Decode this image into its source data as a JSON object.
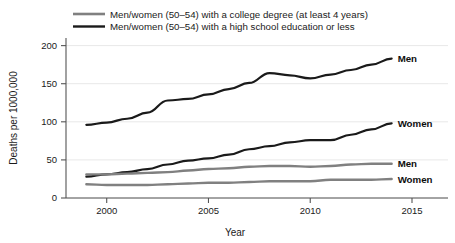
{
  "chart_data": {
    "type": "line",
    "title": "",
    "xlabel": "Year",
    "ylabel": "Deaths per 1000,000",
    "xlim": [
      1998,
      2015
    ],
    "ylim": [
      0,
      210
    ],
    "xticks": [
      2000,
      2005,
      2010,
      2015
    ],
    "yticks": [
      0,
      50,
      100,
      150,
      200
    ],
    "grid": "horizontal",
    "legend_position": "top-left",
    "legend": [
      {
        "label": "Men/women (50–54) with a college degree (at least 4 years)",
        "color": "#808080"
      },
      {
        "label": "Men/women (50–54) with a high school education or less",
        "color": "#1a1a1a"
      }
    ],
    "x": [
      1999,
      2000,
      2001,
      2002,
      2003,
      2004,
      2005,
      2006,
      2007,
      2008,
      2009,
      2010,
      2011,
      2012,
      2013,
      2014
    ],
    "series": [
      {
        "name": "Men",
        "group": "high school or less",
        "color": "#1a1a1a",
        "end_label": "Men",
        "values": [
          96,
          99,
          104,
          112,
          128,
          130,
          136,
          143,
          151,
          164,
          161,
          157,
          162,
          168,
          175,
          183
        ]
      },
      {
        "name": "Women",
        "group": "high school or less",
        "color": "#1a1a1a",
        "end_label": "Women",
        "values": [
          28,
          31,
          34,
          38,
          44,
          49,
          52,
          57,
          64,
          68,
          73,
          76,
          76,
          83,
          90,
          98
        ]
      },
      {
        "name": "Men",
        "group": "college degree",
        "color": "#808080",
        "end_label": "Men",
        "values": [
          31,
          31,
          32,
          33,
          34,
          36,
          38,
          39,
          41,
          42,
          42,
          41,
          42,
          44,
          45,
          45
        ]
      },
      {
        "name": "Women",
        "group": "college degree",
        "color": "#808080",
        "end_label": "Women",
        "values": [
          18,
          17,
          17,
          17,
          18,
          19,
          20,
          20,
          21,
          22,
          22,
          22,
          24,
          24,
          24,
          25
        ]
      }
    ]
  }
}
